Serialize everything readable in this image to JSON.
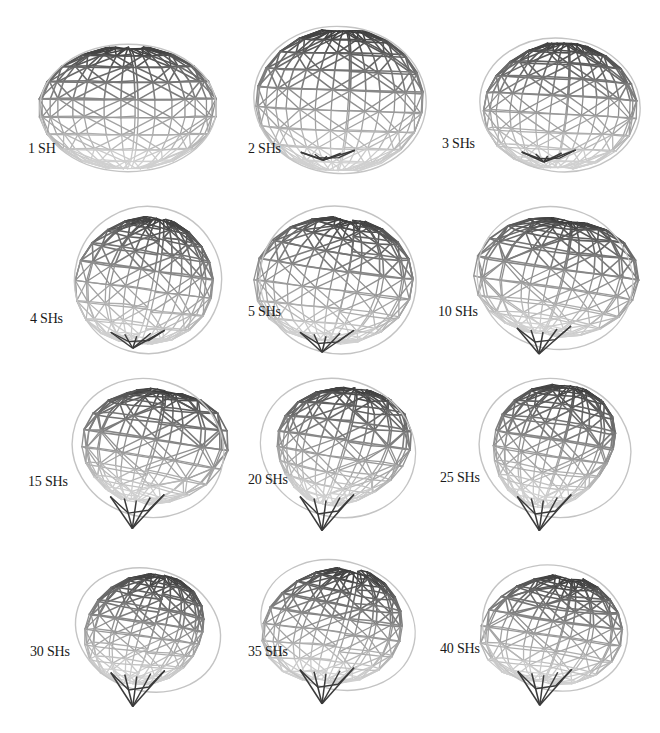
{
  "figure": {
    "panels": [
      {
        "label": "1 SH",
        "shape": "ellipsoid",
        "cx": 128,
        "cy": 108,
        "rx": 90,
        "ry": 65,
        "tilt": 0,
        "tip": 0,
        "bump": 0
      },
      {
        "label": "2 SHs",
        "shape": "blob",
        "cx": 340,
        "cy": 100,
        "rx": 88,
        "ry": 75,
        "tilt": 8,
        "tip": 4,
        "bump": 0.05
      },
      {
        "label": "3 SHs",
        "shape": "blob",
        "cx": 560,
        "cy": 105,
        "rx": 82,
        "ry": 68,
        "tilt": 12,
        "tip": 6,
        "bump": 0.08
      },
      {
        "label": "4 SHs",
        "shape": "blob",
        "cx": 148,
        "cy": 280,
        "rx": 75,
        "ry": 75,
        "tilt": 25,
        "tip": 12,
        "bump": 0.12
      },
      {
        "label": "5 SHs",
        "shape": "blob",
        "cx": 338,
        "cy": 280,
        "rx": 80,
        "ry": 75,
        "tilt": 25,
        "tip": 16,
        "bump": 0.14
      },
      {
        "label": "10 SHs",
        "shape": "blob",
        "cx": 555,
        "cy": 278,
        "rx": 80,
        "ry": 72,
        "tilt": 28,
        "tip": 22,
        "bump": 0.16
      },
      {
        "label": "15 SHs",
        "shape": "blob",
        "cx": 148,
        "cy": 448,
        "rx": 78,
        "ry": 70,
        "tilt": 30,
        "tip": 28,
        "bump": 0.18
      },
      {
        "label": "20 SHs",
        "shape": "blob",
        "cx": 338,
        "cy": 448,
        "rx": 80,
        "ry": 70,
        "tilt": 30,
        "tip": 30,
        "bump": 0.18
      },
      {
        "label": "25 SHs",
        "shape": "blob",
        "cx": 555,
        "cy": 448,
        "rx": 78,
        "ry": 70,
        "tilt": 30,
        "tip": 30,
        "bump": 0.2
      },
      {
        "label": "30 SHs",
        "shape": "blob",
        "cx": 148,
        "cy": 630,
        "rx": 75,
        "ry": 62,
        "tilt": 30,
        "tip": 30,
        "bump": 0.2
      },
      {
        "label": "35 SHs",
        "shape": "blob",
        "cx": 338,
        "cy": 625,
        "rx": 80,
        "ry": 65,
        "tilt": 30,
        "tip": 30,
        "bump": 0.2
      },
      {
        "label": "40 SHs",
        "shape": "blob",
        "cx": 555,
        "cy": 628,
        "rx": 75,
        "ry": 63,
        "tilt": 30,
        "tip": 30,
        "bump": 0.2
      }
    ],
    "label_positions": [
      {
        "x": 28,
        "y": 155
      },
      {
        "x": 248,
        "y": 155
      },
      {
        "x": 442,
        "y": 150
      },
      {
        "x": 30,
        "y": 325
      },
      {
        "x": 248,
        "y": 318
      },
      {
        "x": 438,
        "y": 318
      },
      {
        "x": 28,
        "y": 488
      },
      {
        "x": 248,
        "y": 486
      },
      {
        "x": 440,
        "y": 484
      },
      {
        "x": 30,
        "y": 658
      },
      {
        "x": 248,
        "y": 658
      },
      {
        "x": 440,
        "y": 655
      }
    ],
    "colors": {
      "edge_dark": "#3a3a3a",
      "edge_mid": "#7a7a7a",
      "edge_light": "#c4c4c4",
      "label": "#1a1a1a",
      "background": "#ffffff"
    }
  }
}
